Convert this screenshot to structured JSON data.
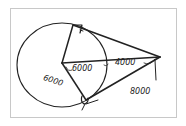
{
  "diagram": {
    "type": "hand-drawn geometry sketch",
    "labels": {
      "radius_lower": "6000",
      "radius_center": "6000",
      "outside_segment": "4000",
      "tangent_length": "8000"
    },
    "colors": {
      "stroke": "#222222",
      "frame": "#c8c8c8"
    }
  }
}
